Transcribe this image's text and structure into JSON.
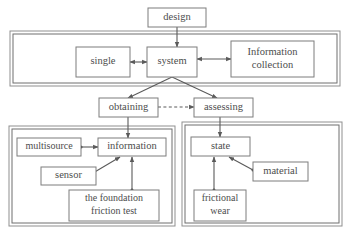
{
  "diagram": {
    "colors": {
      "box_stroke": "#7d7d7d",
      "frame_stroke": "#8f8f8f",
      "text": "#4d4d4d",
      "edge": "#5a5a5a",
      "background": "#ffffff"
    },
    "frames": [
      {
        "name": "system-band",
        "x": 10,
        "y": 31,
        "w": 330,
        "h": 55,
        "inset": 3
      },
      {
        "name": "obtaining-panel",
        "x": 9,
        "y": 126,
        "w": 166,
        "h": 100,
        "inset": 3
      },
      {
        "name": "assessing-panel",
        "x": 182,
        "y": 122,
        "w": 160,
        "h": 104,
        "inset": 3
      }
    ],
    "nodes": [
      {
        "name": "design",
        "label": "design",
        "lines": [
          "design"
        ],
        "x": 148,
        "y": 8,
        "w": 58,
        "h": 19,
        "font": 10.5
      },
      {
        "name": "single",
        "label": "single",
        "lines": [
          "single"
        ],
        "x": 76,
        "y": 47,
        "w": 54,
        "h": 30,
        "font": 10.5
      },
      {
        "name": "system",
        "label": "system",
        "lines": [
          "system"
        ],
        "x": 147,
        "y": 47,
        "w": 50,
        "h": 30,
        "font": 10.5
      },
      {
        "name": "information-collection",
        "label": "Information collection",
        "lines": [
          "Information",
          "collection"
        ],
        "x": 231,
        "y": 41,
        "w": 83,
        "h": 36,
        "font": 10.5
      },
      {
        "name": "obtaining",
        "label": "obtaining",
        "lines": [
          "obtaining"
        ],
        "x": 99,
        "y": 98,
        "w": 59,
        "h": 19,
        "font": 10.5
      },
      {
        "name": "assessing",
        "label": "assessing",
        "lines": [
          "assessing"
        ],
        "x": 194,
        "y": 98,
        "w": 59,
        "h": 19,
        "font": 10.5
      },
      {
        "name": "multisource",
        "label": "multisource",
        "lines": [
          "multisource"
        ],
        "x": 17,
        "y": 138,
        "w": 64,
        "h": 18,
        "font": 10
      },
      {
        "name": "information",
        "label": "information",
        "lines": [
          "information"
        ],
        "x": 98,
        "y": 138,
        "w": 68,
        "h": 18,
        "font": 10.5
      },
      {
        "name": "sensor",
        "label": "sensor",
        "lines": [
          "sensor"
        ],
        "x": 41,
        "y": 167,
        "w": 55,
        "h": 18,
        "font": 10.5
      },
      {
        "name": "foundation-friction-test",
        "label": "the foundation friction test",
        "lines": [
          "the foundation",
          "friction test"
        ],
        "x": 69,
        "y": 190,
        "w": 90,
        "h": 31,
        "font": 10
      },
      {
        "name": "state",
        "label": "state",
        "lines": [
          "state"
        ],
        "x": 191,
        "y": 137,
        "w": 59,
        "h": 19,
        "font": 10.5
      },
      {
        "name": "material",
        "label": "material",
        "lines": [
          "material"
        ],
        "x": 253,
        "y": 162,
        "w": 55,
        "h": 19,
        "font": 10.5
      },
      {
        "name": "frictional-wear",
        "label": "frictional wear",
        "lines": [
          "frictional",
          "wear"
        ],
        "x": 194,
        "y": 190,
        "w": 52,
        "h": 31,
        "font": 10
      }
    ],
    "edges": [
      {
        "name": "design-to-system",
        "from": "design",
        "to": "system",
        "style": "solid",
        "arrow": "end",
        "path": "M177,27 L177,47",
        "dots": []
      },
      {
        "name": "single-to-system",
        "from": "single",
        "to": "system",
        "style": "solid",
        "arrow": "both",
        "path": "M130,62 L147,62",
        "dots": []
      },
      {
        "name": "information-collection-to-system",
        "from": "information-collection",
        "to": "system",
        "style": "solid",
        "arrow": "both",
        "path": "M231,59 L197,59",
        "dots": []
      },
      {
        "name": "system-to-obtaining",
        "from": "system",
        "to": "obtaining",
        "style": "solid",
        "arrow": "end",
        "path": "M172,77 L128,98",
        "dots": []
      },
      {
        "name": "system-to-assessing",
        "from": "system",
        "to": "assessing",
        "style": "solid",
        "arrow": "end",
        "path": "M172,77 L217,98",
        "dots": []
      },
      {
        "name": "obtaining-to-assessing",
        "from": "obtaining",
        "to": "assessing",
        "style": "dashed",
        "arrow": "end",
        "path": "M158,107 L194,107",
        "dots": []
      },
      {
        "name": "obtaining-to-information",
        "from": "obtaining",
        "to": "information",
        "style": "solid",
        "arrow": "end",
        "path": "M128,117 L128,138",
        "dots": []
      },
      {
        "name": "assessing-to-state",
        "from": "assessing",
        "to": "state",
        "style": "solid",
        "arrow": "end",
        "path": "M220,117 L220,137",
        "dots": []
      },
      {
        "name": "multisource-to-information",
        "from": "multisource",
        "to": "information",
        "style": "solid",
        "arrow": "end",
        "path": "M81,147 L98,147",
        "dots": [
          [
            81,
            147
          ]
        ]
      },
      {
        "name": "sensor-to-information",
        "from": "sensor",
        "to": "information",
        "style": "solid",
        "arrow": "end",
        "path": "M93,173 L120,157",
        "dots": [
          [
            93,
            173
          ]
        ]
      },
      {
        "name": "foundation-to-information",
        "from": "foundation-friction-test",
        "to": "information",
        "style": "solid",
        "arrow": "end",
        "path": "M132,190 L132,157",
        "dots": [
          [
            132,
            190
          ]
        ]
      },
      {
        "name": "frictional-wear-to-state",
        "from": "frictional-wear",
        "to": "state",
        "style": "solid",
        "arrow": "end",
        "path": "M214,190 L214,157",
        "dots": [
          [
            214,
            190
          ]
        ]
      },
      {
        "name": "material-to-state",
        "from": "material",
        "to": "state",
        "style": "solid",
        "arrow": "end",
        "path": "M253,170 L229,157",
        "dots": [
          [
            253,
            170
          ]
        ]
      }
    ]
  }
}
